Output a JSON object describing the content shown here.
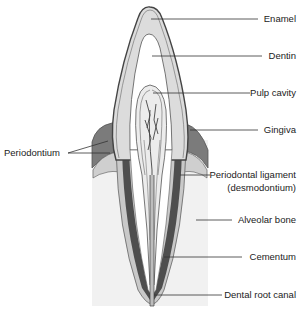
{
  "labels": {
    "enamel": "Enamel",
    "dentin": "Dentin",
    "pulp_cavity": "Pulp cavity",
    "gingiva": "Gingiva",
    "periodontium": "Periodontium",
    "periodontal_ligament": "Periodontal ligament",
    "periodontal_ligament_alt": "(desmodontium)",
    "alveolar_bone": "Alveolar bone",
    "cementum": "Cementum",
    "dental_root_canal": "Dental root canal"
  },
  "colors": {
    "background": "#ffffff",
    "alveolar_bone": "#f2f2f2",
    "gingiva": "#7a7a7a",
    "enamel_dentin_fill": "#dcdcdc",
    "cementum": "#c8c8c8",
    "ligament_dark": "#505050",
    "outline": "#444444",
    "leader_line": "#333333"
  }
}
